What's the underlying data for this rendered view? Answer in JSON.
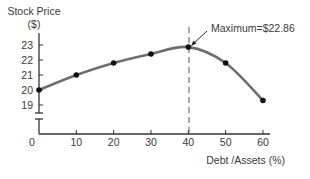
{
  "chart_data": {
    "type": "line",
    "title": "",
    "ylabel": "Stock Price ($)",
    "ylabel_line1": "Stock Price",
    "ylabel_line2": "($)",
    "xlabel": "Debt /Assets (%)",
    "x": [
      0,
      10,
      20,
      30,
      40,
      50,
      60
    ],
    "series": [
      {
        "name": "Stock Price",
        "values": [
          20.0,
          21.0,
          21.8,
          22.4,
          22.86,
          21.8,
          19.3
        ]
      }
    ],
    "x_ticks": [
      "0",
      "10",
      "20",
      "30",
      "40",
      "50",
      "60"
    ],
    "y_ticks": [
      "19",
      "20",
      "21",
      "22",
      "23"
    ],
    "ylim": [
      19,
      23
    ],
    "xlim": [
      0,
      60
    ],
    "axis_break": true,
    "grid": false,
    "annotation": {
      "text": "Maximum=$22.86",
      "x": 40,
      "y": 22.86,
      "vline": true
    },
    "colors": {
      "line": "#6e6e6e",
      "points": "#111111",
      "axis": "#333333"
    }
  }
}
